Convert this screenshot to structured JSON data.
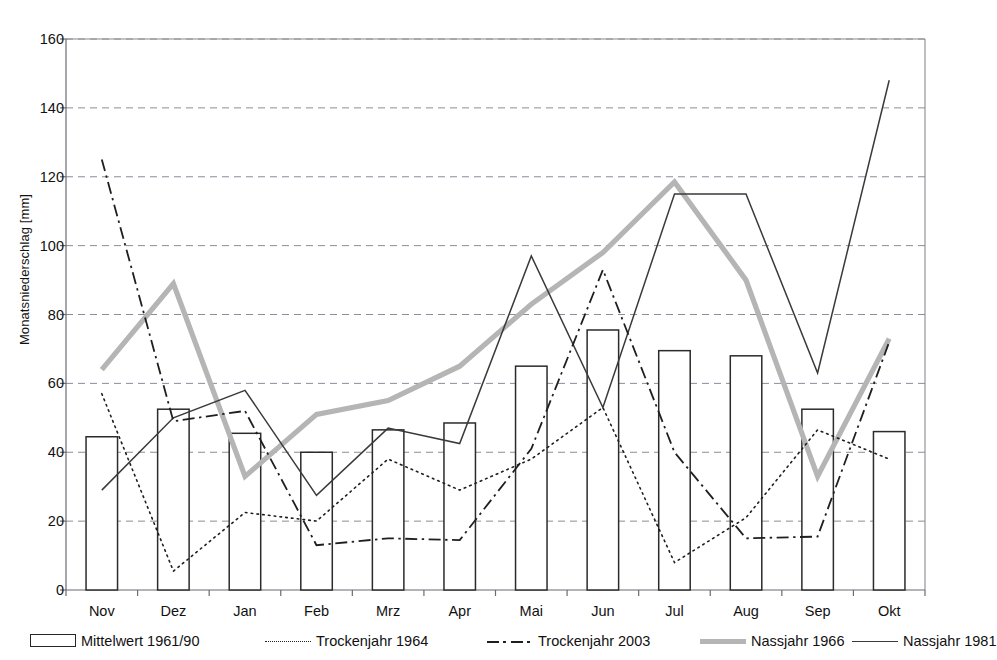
{
  "chart_data": {
    "type": "line",
    "title": "",
    "xlabel": "",
    "ylabel": "Monatsniederschlag [mm]",
    "categories": [
      "Nov",
      "Dez",
      "Jan",
      "Feb",
      "Mrz",
      "Apr",
      "Mai",
      "Jun",
      "Jul",
      "Aug",
      "Sep",
      "Okt"
    ],
    "ylim": [
      0,
      160
    ],
    "yticks": [
      0,
      20,
      40,
      60,
      80,
      100,
      120,
      140,
      160
    ],
    "grid": true,
    "legend_position": "bottom",
    "series": [
      {
        "name": "Mittelwert 1961/90",
        "style": "bar",
        "color": "#ffffff",
        "stroke": "#2b2b2b",
        "values": [
          44.5,
          52.5,
          45.5,
          40.0,
          46.5,
          48.5,
          65.0,
          75.5,
          69.5,
          68.0,
          52.5,
          46.0
        ]
      },
      {
        "name": "Trockenjahr 1964",
        "style": "dotted",
        "color": "#1f1f1f",
        "values": [
          57.0,
          5.5,
          22.5,
          20.0,
          38.0,
          29.0,
          38.0,
          53.0,
          8.0,
          21.0,
          46.5,
          38.0
        ]
      },
      {
        "name": "Trockenjahr 2003",
        "style": "dash-dot",
        "color": "#1f1f1f",
        "values": [
          125.0,
          49.0,
          52.0,
          13.0,
          15.0,
          14.5,
          41.0,
          93.0,
          40.0,
          15.0,
          15.5,
          72.0
        ]
      },
      {
        "name": "Nassjahr 1966",
        "style": "thick-gray",
        "color": "#b5b5b5",
        "values": [
          64.0,
          89.0,
          33.0,
          51.0,
          55.0,
          65.0,
          83.0,
          98.0,
          118.5,
          90.0,
          33.0,
          73.0
        ]
      },
      {
        "name": "Nassjahr 1981",
        "style": "thin-solid",
        "color": "#3a3a3a",
        "values": [
          29.0,
          50.0,
          58.0,
          27.5,
          47.0,
          42.5,
          97.0,
          53.0,
          115.0,
          115.0,
          63.0,
          148.0
        ]
      }
    ]
  }
}
